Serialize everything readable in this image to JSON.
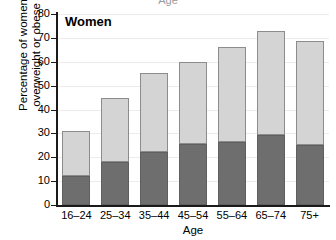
{
  "top_clipped_label": "Age",
  "panel": {
    "label": "Women"
  },
  "axis": {
    "y_title_line1": "Percentage of women",
    "y_title_line2": "overweight or obese",
    "x_title": "Age"
  },
  "colors": {
    "overweight": "#d4d4d4",
    "obese": "#6e6e6e",
    "axis": "#1a1a1a",
    "grid": "#ececec",
    "background": "#ffffff"
  },
  "chart_data": {
    "type": "bar",
    "title": "Women",
    "xlabel": "Age",
    "ylabel": "Percentage of women overweight or obese",
    "stacked": true,
    "grid": true,
    "legend": "none",
    "ylim": [
      0,
      80
    ],
    "yticks": [
      0,
      10,
      20,
      30,
      40,
      50,
      60,
      70,
      80
    ],
    "ytick_labels": [
      "0",
      "10",
      "20",
      "30",
      "40",
      "50",
      "60",
      "70",
      "80"
    ],
    "categories": [
      "16–24",
      "25–34",
      "35–44",
      "45–54",
      "55–64",
      "65–74",
      "75+"
    ],
    "series": [
      {
        "name": "Obese",
        "color": "#6e6e6e",
        "values": [
          12,
          18,
          22,
          25.5,
          26.5,
          29.5,
          25
        ]
      },
      {
        "name": "Overweight",
        "color": "#d4d4d4",
        "values": [
          19,
          27,
          33.5,
          34.5,
          39.5,
          43.5,
          43.5
        ]
      }
    ],
    "totals": [
      31,
      45,
      55.5,
      60,
      66,
      73,
      68.5
    ]
  }
}
